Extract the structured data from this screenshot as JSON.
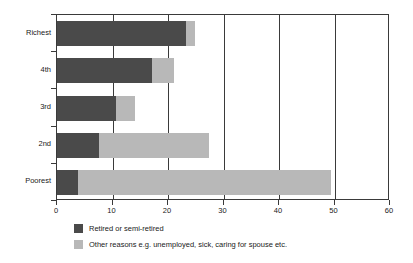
{
  "chart_data": {
    "type": "bar",
    "orientation": "horizontal",
    "stacked": true,
    "title": "",
    "xlabel": "",
    "ylabel": "",
    "categories": [
      "Richest",
      "4th",
      "3rd",
      "2nd",
      "Poorest"
    ],
    "series": [
      {
        "name": "Retired or semi-retired",
        "color": "#4a4a4a",
        "values": [
          23.3,
          17.2,
          10.6,
          7.5,
          3.8
        ]
      },
      {
        "name": "Other reasons e.g. unemployed, sick, caring for spouse etc.",
        "color": "#b8b8b8",
        "values": [
          1.6,
          3.9,
          3.5,
          19.9,
          45.5
        ]
      }
    ],
    "totals": [
      24.9,
      21.1,
      14.1,
      27.4,
      49.3
    ],
    "xlim": [
      0,
      60
    ],
    "xticks": [
      0,
      10,
      20,
      30,
      40,
      50,
      60
    ],
    "xtick_labels": [
      "0",
      "10",
      "20",
      "30",
      "40",
      "50",
      "60"
    ],
    "gridlines_x": [
      10,
      20,
      30,
      40,
      50
    ],
    "grid": true,
    "legend_position": "bottom-left"
  },
  "axis": {
    "x_tick_labels": [
      "0",
      "10",
      "20",
      "30",
      "40",
      "50",
      "60"
    ],
    "y_tick_labels": [
      "Richest",
      "4th",
      "3rd",
      "2nd",
      "Poorest"
    ]
  },
  "legend": {
    "items": [
      {
        "label": "Retired or semi-retired",
        "color": "#4a4a4a"
      },
      {
        "label": "Other reasons e.g. unemployed, sick, caring for spouse etc.",
        "color": "#b8b8b8"
      }
    ]
  }
}
